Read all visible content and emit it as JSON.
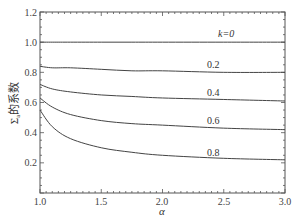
{
  "chart_data": {
    "type": "line",
    "title": "",
    "xlabel": "α",
    "ylabel": "Σa的系数",
    "xlim": [
      1.0,
      3.0
    ],
    "ylim": [
      0.0,
      1.2
    ],
    "xticks": [
      "1.0",
      "1.5",
      "2.0",
      "2.5",
      "3.0"
    ],
    "yticks": [
      "0.2",
      "0.4",
      "0.6",
      "0.8",
      "1.0",
      "1.2"
    ],
    "grid": false,
    "legend": "inline labels",
    "x": [
      1.0,
      1.1,
      1.25,
      1.5,
      1.75,
      2.0,
      2.5,
      3.0
    ],
    "series": [
      {
        "name": "k=0",
        "label": "k=0",
        "values": [
          1.0,
          1.0,
          1.0,
          1.0,
          1.0,
          1.0,
          1.0,
          1.0
        ]
      },
      {
        "name": "k=0.2",
        "label": "0.2",
        "values": [
          0.84,
          0.83,
          0.83,
          0.82,
          0.81,
          0.81,
          0.8,
          0.8
        ]
      },
      {
        "name": "k=0.4",
        "label": "0.4",
        "values": [
          0.72,
          0.69,
          0.67,
          0.65,
          0.64,
          0.63,
          0.62,
          0.61
        ]
      },
      {
        "name": "k=0.6",
        "label": "0.6",
        "values": [
          0.63,
          0.57,
          0.52,
          0.48,
          0.46,
          0.45,
          0.43,
          0.42
        ]
      },
      {
        "name": "k=0.8",
        "label": "0.8",
        "values": [
          0.55,
          0.44,
          0.36,
          0.3,
          0.27,
          0.25,
          0.23,
          0.22
        ]
      }
    ]
  },
  "labels": {
    "xlabel": "α",
    "ylabel_main": "Σ",
    "ylabel_sub": "a",
    "ylabel_rest": "的系数",
    "xticks": [
      "1.0",
      "1.5",
      "2.0",
      "2.5",
      "3.0"
    ],
    "yticks": [
      "0.2",
      "0.4",
      "0.6",
      "0.8",
      "1.0",
      "1.2"
    ],
    "curves": [
      "k=0",
      "0.2",
      "0.4",
      "0.6",
      "0.8"
    ]
  }
}
